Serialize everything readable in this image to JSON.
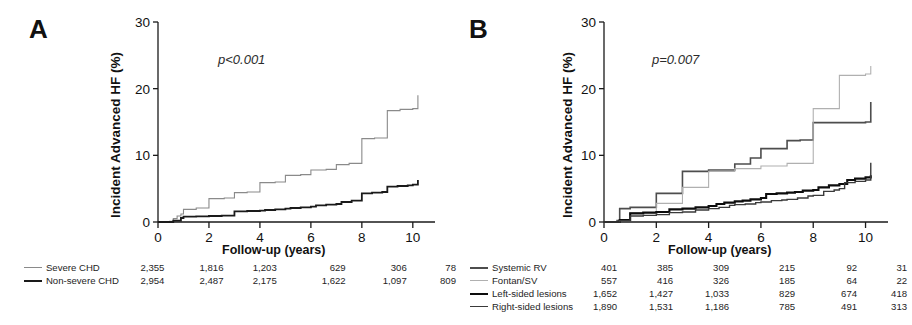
{
  "figure": {
    "panels": [
      {
        "letter": "A",
        "p_value": "p<0.001",
        "ylabel": "Incident Advanced HF (%)",
        "xlabel": "Follow-up (years)",
        "risk_table": [
          {
            "label": "Severe CHD",
            "values": [
              "2,355",
              "1,816",
              "1,203",
              "629",
              "306",
              "78"
            ]
          },
          {
            "label": "Non-severe CHD",
            "values": [
              "2,954",
              "2,487",
              "2,175",
              "1,622",
              "1,097",
              "809"
            ]
          }
        ]
      },
      {
        "letter": "B",
        "p_value": "p=0.007",
        "ylabel": "Incident Advanced HF (%)",
        "xlabel": "Follow-up (years)",
        "risk_table": [
          {
            "label": "Systemic RV",
            "values": [
              "401",
              "385",
              "309",
              "215",
              "92",
              "31"
            ]
          },
          {
            "label": "Fontan/SV",
            "values": [
              "557",
              "416",
              "326",
              "185",
              "64",
              "22"
            ]
          },
          {
            "label": "Left-sided lesions",
            "values": [
              "1,652",
              "1,427",
              "1,033",
              "829",
              "674",
              "418"
            ]
          },
          {
            "label": "Right-sided lesions",
            "values": [
              "1,890",
              "1,531",
              "1,186",
              "785",
              "491",
              "313"
            ]
          }
        ]
      }
    ]
  },
  "chart_data": [
    {
      "type": "line",
      "title": "A",
      "subtitle": "p<0.001",
      "xlabel": "Follow-up (years)",
      "ylabel": "Incident Advanced HF (%)",
      "xlim": [
        0,
        10.4
      ],
      "ylim": [
        0,
        30
      ],
      "xticks": [
        0,
        2,
        4,
        6,
        8,
        10
      ],
      "yticks": [
        0,
        10,
        20,
        30
      ],
      "grid": false,
      "legend_position": "below-axis-risk-table",
      "step": "post",
      "series": [
        {
          "name": "Severe CHD",
          "color": "#8a8a8a",
          "width": 1.1,
          "x": [
            0,
            0.45,
            0.6,
            0.75,
            0.9,
            1.0,
            1.5,
            2.0,
            2.0,
            2.6,
            3.0,
            3.0,
            3.5,
            4.0,
            4.0,
            4.6,
            5.0,
            5.0,
            5.6,
            6.0,
            6.0,
            6.6,
            7.0,
            7.0,
            7.5,
            8.0,
            8.0,
            8.5,
            9.0,
            9.0,
            9.5,
            10.0,
            10.2
          ],
          "y": [
            0,
            0.1,
            0.5,
            0.9,
            1.2,
            1.9,
            2.1,
            2.3,
            3.5,
            3.6,
            3.7,
            4.4,
            4.5,
            4.6,
            5.9,
            6.0,
            6.1,
            7.0,
            7.1,
            7.2,
            7.8,
            7.9,
            8.0,
            8.6,
            8.8,
            9.0,
            12.5,
            12.6,
            12.7,
            16.7,
            16.9,
            17.0,
            19.0
          ],
          "risk_numbers": [
            "2,355",
            "1,816",
            "1,203",
            "629",
            "306",
            "78"
          ]
        },
        {
          "name": "Non-severe CHD",
          "color": "#1a1a1a",
          "width": 1.8,
          "x": [
            0,
            0.6,
            0.9,
            1.0,
            1.5,
            2.0,
            2.5,
            3.0,
            3.0,
            3.5,
            4.0,
            4.2,
            4.6,
            5.0,
            5.2,
            5.6,
            6.0,
            6.2,
            6.6,
            7.0,
            7.2,
            7.6,
            8.0,
            8.0,
            8.4,
            8.8,
            9.0,
            9.0,
            9.4,
            9.8,
            10.0,
            10.2
          ],
          "y": [
            0,
            0.2,
            0.6,
            0.8,
            0.85,
            0.9,
            0.95,
            1.0,
            1.6,
            1.65,
            1.7,
            1.8,
            1.9,
            2.0,
            2.1,
            2.2,
            2.3,
            2.5,
            2.6,
            2.7,
            3.0,
            3.2,
            3.3,
            4.3,
            4.4,
            4.5,
            4.6,
            5.3,
            5.4,
            5.5,
            5.6,
            6.3
          ],
          "risk_numbers": [
            "2,954",
            "2,487",
            "2,175",
            "1,622",
            "1,097",
            "809"
          ]
        }
      ]
    },
    {
      "type": "line",
      "title": "B",
      "subtitle": "p=0.007",
      "xlabel": "Follow-up (years)",
      "ylabel": "Incident Advanced HF (%)",
      "xlim": [
        0,
        10.4
      ],
      "ylim": [
        0,
        30
      ],
      "xticks": [
        0,
        2,
        4,
        6,
        8,
        10
      ],
      "yticks": [
        0,
        10,
        20,
        30
      ],
      "grid": false,
      "legend_position": "below-axis-risk-table",
      "step": "post",
      "series": [
        {
          "name": "Systemic RV",
          "color": "#4d4d4d",
          "width": 1.6,
          "x": [
            0,
            0.5,
            0.6,
            1.0,
            1.0,
            2.0,
            2.0,
            3.0,
            3.0,
            4.0,
            4.0,
            5.0,
            5.0,
            5.6,
            6.0,
            6.0,
            7.0,
            7.0,
            7.5,
            8.0,
            8.0,
            10.0,
            10.2
          ],
          "y": [
            0,
            0.2,
            2.0,
            2.1,
            2.2,
            2.3,
            4.3,
            4.4,
            7.6,
            7.7,
            7.8,
            7.9,
            8.7,
            9.6,
            9.7,
            11.0,
            11.1,
            12.2,
            12.3,
            12.4,
            14.9,
            15.0,
            18.0
          ],
          "risk_numbers": [
            "401",
            "385",
            "309",
            "215",
            "92",
            "31"
          ]
        },
        {
          "name": "Fontan/SV",
          "color": "#b0b0b0",
          "width": 1.1,
          "x": [
            0,
            0.6,
            1.0,
            1.0,
            2.0,
            2.0,
            3.0,
            3.0,
            4.0,
            4.0,
            5.0,
            5.0,
            6.0,
            6.0,
            7.0,
            7.0,
            8.0,
            8.0,
            9.0,
            9.0,
            10.0,
            10.2
          ],
          "y": [
            0,
            0.3,
            0.5,
            1.4,
            1.5,
            2.8,
            2.9,
            5.2,
            5.3,
            7.6,
            7.7,
            8.0,
            8.1,
            8.4,
            8.5,
            8.8,
            8.9,
            17.0,
            17.1,
            22.0,
            22.2,
            23.4
          ],
          "risk_numbers": [
            "557",
            "416",
            "326",
            "185",
            "64",
            "22"
          ]
        },
        {
          "name": "Left-sided lesions",
          "color": "#0d0d0d",
          "width": 2.1,
          "x": [
            0,
            0.6,
            1.0,
            1.5,
            2.0,
            2.5,
            3.0,
            3.5,
            4.0,
            4.3,
            4.6,
            5.0,
            5.3,
            5.6,
            6.0,
            6.2,
            6.6,
            7.0,
            7.3,
            7.6,
            8.0,
            8.2,
            8.6,
            9.0,
            9.3,
            9.6,
            10.0,
            10.2
          ],
          "y": [
            0,
            0.3,
            1.3,
            1.4,
            1.5,
            1.9,
            2.0,
            2.2,
            2.4,
            2.7,
            2.9,
            3.1,
            3.2,
            3.4,
            3.6,
            4.2,
            4.3,
            4.4,
            4.5,
            4.7,
            4.8,
            5.2,
            5.5,
            5.7,
            6.3,
            6.5,
            6.7,
            7.0
          ],
          "risk_numbers": [
            "1,652",
            "1,427",
            "1,033",
            "829",
            "674",
            "418"
          ]
        },
        {
          "name": "Right-sided lesions",
          "color": "#3a3a3a",
          "width": 1.4,
          "x": [
            0,
            0.6,
            1.0,
            1.5,
            2.0,
            2.5,
            3.0,
            3.5,
            4.0,
            4.4,
            4.8,
            5.0,
            5.4,
            5.8,
            6.0,
            6.4,
            6.8,
            7.0,
            7.4,
            7.8,
            8.0,
            8.4,
            8.8,
            9.0,
            9.2,
            9.6,
            10.0,
            10.2
          ],
          "y": [
            0,
            0.2,
            0.9,
            1.0,
            1.1,
            1.4,
            1.5,
            1.8,
            2.0,
            2.2,
            2.5,
            2.6,
            2.7,
            2.9,
            3.0,
            3.2,
            3.3,
            3.4,
            3.6,
            3.9,
            4.0,
            4.6,
            4.8,
            5.0,
            5.9,
            6.1,
            6.3,
            8.9
          ],
          "risk_numbers": [
            "1,890",
            "1,531",
            "1,186",
            "785",
            "491",
            "313"
          ]
        }
      ]
    }
  ]
}
